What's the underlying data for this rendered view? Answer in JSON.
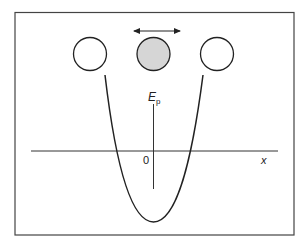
{
  "diagram": {
    "labels": {
      "y_axis": "E",
      "y_axis_sub": "p",
      "x_axis": "x",
      "origin": "0"
    },
    "atoms": [
      {
        "name": "left-atom",
        "fill": "#ffffff"
      },
      {
        "name": "central-atom",
        "fill": "#d6d6d6",
        "note": "oscillating"
      },
      {
        "name": "right-atom",
        "fill": "#ffffff"
      }
    ],
    "arrow": "double-headed horizontal arrow above central atom",
    "curve": "parabola"
  },
  "colors": {
    "stroke": "#222222",
    "frame": "#444444",
    "shaded_atom": "#d6d6d6"
  }
}
